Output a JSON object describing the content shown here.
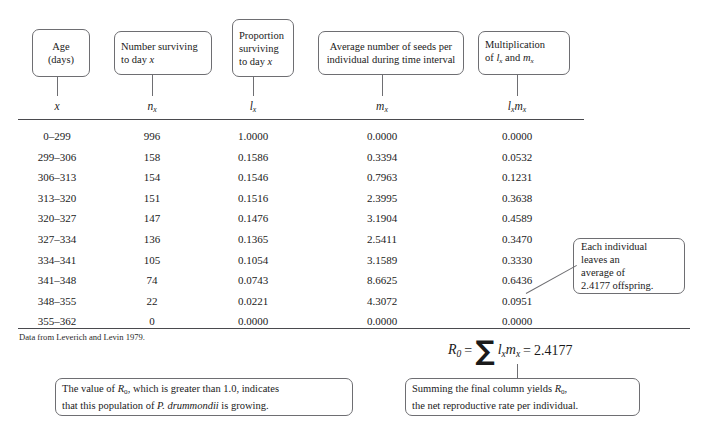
{
  "table": {
    "headers": [
      {
        "id": "age",
        "text": "Age\n(days)",
        "symbol": "x"
      },
      {
        "id": "n-survivors",
        "text": "Number surviving\nto day x",
        "symbol": "nx"
      },
      {
        "id": "proportion",
        "text": "Proportion\nsurviving\nto day x",
        "symbol": "lx"
      },
      {
        "id": "seeds",
        "text": "Average number of seeds per\nindividual during time interval",
        "symbol": "mx"
      },
      {
        "id": "product",
        "text": "Multiplication\nof lx and mx",
        "symbol": "lxmx"
      }
    ],
    "header_lines": [
      [
        "Age",
        "(days)"
      ],
      [
        "Number surviving",
        "to day x"
      ],
      [
        "Proportion",
        "surviving",
        "to day x"
      ],
      [
        "Average number of seeds per",
        "individual during time interval"
      ],
      [
        "Multiplication",
        "of lx and mx"
      ]
    ],
    "rows": [
      {
        "x": "0–299",
        "nx": "996",
        "lx": "1.0000",
        "mx": "0.0000",
        "lxmx": "0.0000"
      },
      {
        "x": "299–306",
        "nx": "158",
        "lx": "0.1586",
        "mx": "0.3394",
        "lxmx": "0.0532"
      },
      {
        "x": "306–313",
        "nx": "154",
        "lx": "0.1546",
        "mx": "0.7963",
        "lxmx": "0.1231"
      },
      {
        "x": "313–320",
        "nx": "151",
        "lx": "0.1516",
        "mx": "2.3995",
        "lxmx": "0.3638"
      },
      {
        "x": "320–327",
        "nx": "147",
        "lx": "0.1476",
        "mx": "3.1904",
        "lxmx": "0.4589"
      },
      {
        "x": "327–334",
        "nx": "136",
        "lx": "0.1365",
        "mx": "2.5411",
        "lxmx": "0.3470"
      },
      {
        "x": "334–341",
        "nx": "105",
        "lx": "0.1054",
        "mx": "3.1589",
        "lxmx": "0.3330"
      },
      {
        "x": "341–348",
        "nx": "74",
        "lx": "0.0743",
        "mx": "8.6625",
        "lxmx": "0.6436"
      },
      {
        "x": "348–355",
        "nx": "22",
        "lx": "0.0221",
        "mx": "4.3072",
        "lxmx": "0.0951"
      },
      {
        "x": "355–362",
        "nx": "0",
        "lx": "0.0000",
        "mx": "0.0000",
        "lxmx": "0.0000"
      }
    ],
    "source_note": "Data from Leverich and Levin 1979."
  },
  "equation": {
    "lhs": "R0",
    "equals": "=",
    "sigma": "∑",
    "term": "lxmx",
    "equals2": "=",
    "value": "2.4177"
  },
  "callouts": {
    "each_individual": [
      "Each individual",
      "leaves an",
      "average of",
      "2.4177 offspring."
    ],
    "left": [
      "The value of R0, which is greater than 1.0, indicates",
      "that this population of P. drummondii is growing."
    ],
    "right": [
      "Summing the final column yields R0,",
      "the net reproductive rate per individual."
    ]
  },
  "chart_data": {
    "type": "table",
    "columns": [
      "x",
      "nx",
      "lx",
      "mx",
      "lxmx"
    ],
    "column_descriptions": [
      "Age (days)",
      "Number surviving to day x",
      "Proportion surviving to day x",
      "Average number of seeds per individual during time interval",
      "Multiplication of lx and mx"
    ],
    "x": [
      "0-299",
      "299-306",
      "306-313",
      "313-320",
      "320-327",
      "327-334",
      "334-341",
      "341-348",
      "348-355",
      "355-362"
    ],
    "nx": [
      996,
      158,
      154,
      151,
      147,
      136,
      105,
      74,
      22,
      0
    ],
    "lx": [
      1.0,
      0.1586,
      0.1546,
      0.1516,
      0.1476,
      0.1365,
      0.1054,
      0.0743,
      0.0221,
      0.0
    ],
    "mx": [
      0.0,
      0.3394,
      0.7963,
      2.3995,
      3.1904,
      2.5411,
      3.1589,
      8.6625,
      4.3072,
      0.0
    ],
    "lxmx": [
      0.0,
      0.0532,
      0.1231,
      0.3638,
      0.4589,
      0.347,
      0.333,
      0.6436,
      0.0951,
      0.0
    ],
    "R0": 2.4177,
    "source": "Leverich and Levin 1979"
  }
}
